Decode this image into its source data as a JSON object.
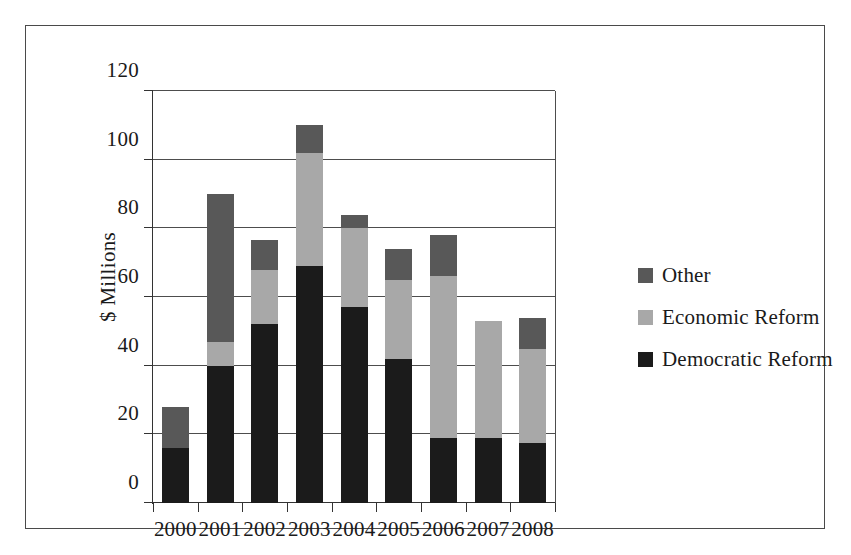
{
  "chart_data": {
    "type": "bar",
    "stacked": true,
    "title": "",
    "subtitle": "",
    "xlabel": "",
    "ylabel": "$ Millions",
    "categories": [
      "2000",
      "2001",
      "2002",
      "2003",
      "2004",
      "2005",
      "2006",
      "2007",
      "2008"
    ],
    "series": [
      {
        "name": "Democratic Reform",
        "color": "#1b1b1b",
        "values": [
          16,
          40,
          52,
          69,
          57,
          42,
          19,
          19,
          17.5
        ]
      },
      {
        "name": "Economic Reform",
        "color": "#a8a8a8",
        "values": [
          0,
          7,
          16,
          33,
          23,
          23,
          47,
          34,
          27.5
        ]
      },
      {
        "name": "Other",
        "color": "#585858",
        "values": [
          12,
          43,
          8.5,
          8,
          4,
          9,
          12,
          0,
          9
        ]
      }
    ],
    "totals": [
      28,
      90,
      76.5,
      110,
      84,
      74,
      78,
      53,
      54
    ],
    "ylim": [
      0,
      120
    ],
    "ytick_values": [
      0,
      20,
      40,
      60,
      80,
      100,
      120
    ],
    "ytick_labels": [
      "0",
      "20",
      "40",
      "60",
      "80",
      "100",
      "120"
    ],
    "grid": "horizontal",
    "legend_position": "right",
    "legend_order": [
      "Other",
      "Economic Reform",
      "Democratic Reform"
    ],
    "annotations": []
  },
  "legend": {
    "entries": [
      {
        "label": "Other",
        "color": "#585858"
      },
      {
        "label": "Economic Reform",
        "color": "#a8a8a8"
      },
      {
        "label": "Democratic Reform",
        "color": "#1b1b1b"
      }
    ]
  },
  "axes": {
    "y_title": "$ Millions"
  },
  "colors": {
    "frame": "#4a4a4a",
    "axis": "#333333",
    "grid": "#4d4d4d",
    "background": "#ffffff",
    "text": "#1a1a1a"
  }
}
